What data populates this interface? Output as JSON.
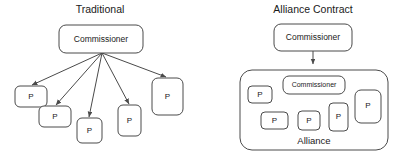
{
  "figure": {
    "background_color": "#ffffff",
    "stroke_color": "#4a4a4a",
    "text_color": "#1a1a1a"
  },
  "panels": [
    {
      "id": "traditional",
      "title": "Traditional",
      "root_node": {
        "label": "Commissioner"
      },
      "children": [
        {
          "label": "P"
        },
        {
          "label": "P"
        },
        {
          "label": "P"
        },
        {
          "label": "P"
        },
        {
          "label": "P"
        }
      ],
      "edge_count": 5,
      "edge_direction": "root-to-children"
    },
    {
      "id": "alliance-contract",
      "title": "Alliance Contract",
      "root_node": {
        "label": "Commissioner"
      },
      "group": {
        "label": "Alliance",
        "members": [
          {
            "label": "Commissioner"
          },
          {
            "label": "P"
          },
          {
            "label": "P"
          },
          {
            "label": "P"
          },
          {
            "label": "P"
          },
          {
            "label": "P"
          }
        ]
      },
      "edge_count": 1,
      "edge_direction": "root-to-group"
    }
  ]
}
